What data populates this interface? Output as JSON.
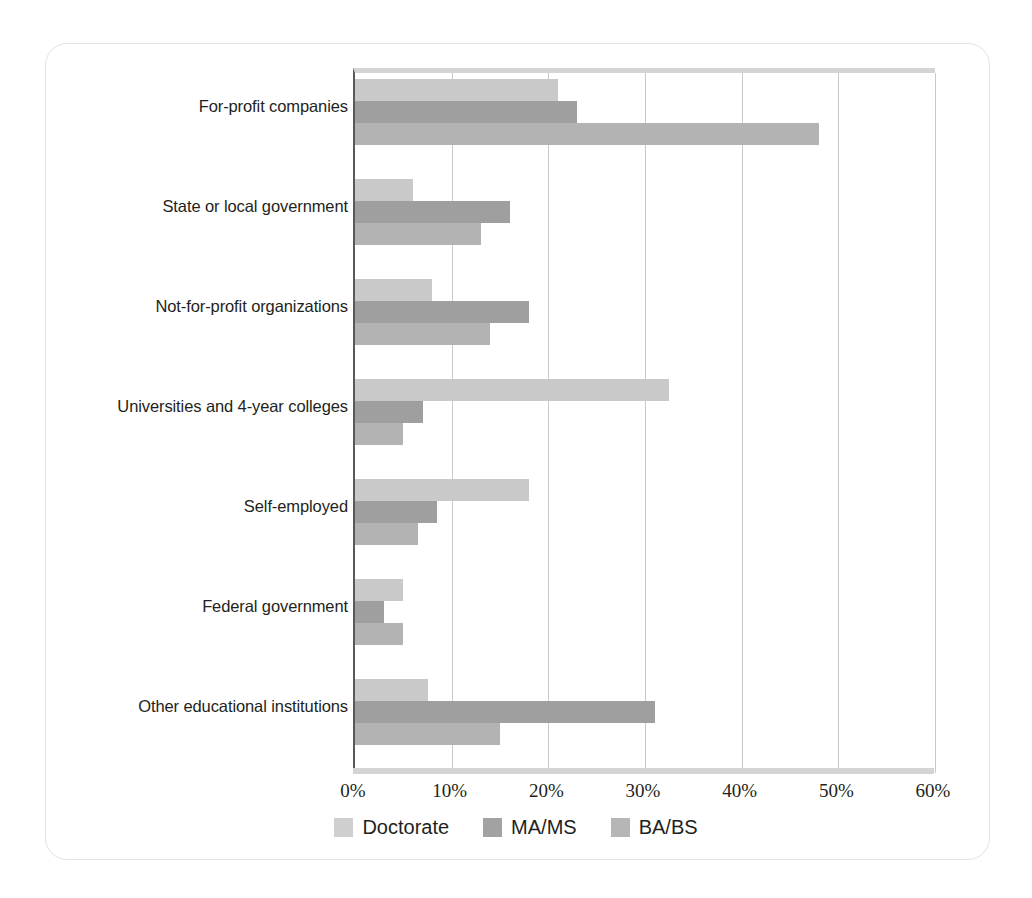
{
  "chart_data": {
    "type": "bar",
    "orientation": "horizontal",
    "title": "",
    "xlabel": "",
    "ylabel": "",
    "xlim": [
      0,
      60
    ],
    "xticks": [
      "0%",
      "10%",
      "20%",
      "30%",
      "40%",
      "50%",
      "60%"
    ],
    "xtick_values": [
      0,
      10,
      20,
      30,
      40,
      50,
      60
    ],
    "grid": true,
    "legend_position": "bottom",
    "categories": [
      "For-profit companies",
      "State or local government",
      "Not-for-profit organizations",
      "Universities and 4-year colleges",
      "Self-employed",
      "Federal government",
      "Other educational institutions"
    ],
    "series": [
      {
        "name": "Doctorate",
        "color": "#c9c9c9",
        "values": [
          21,
          6,
          8,
          32.5,
          18,
          5,
          7.5
        ]
      },
      {
        "name": "MA/MS",
        "color": "#9f9f9f",
        "values": [
          23,
          16,
          18,
          7,
          8.5,
          3,
          31
        ]
      },
      {
        "name": "BA/BS",
        "color": "#b3b3b3",
        "values": [
          48,
          13,
          14,
          5,
          6.5,
          5,
          15
        ]
      }
    ],
    "legend": [
      {
        "label": "Doctorate",
        "swatch": "doctorate"
      },
      {
        "label": "MA/MS",
        "swatch": "mams"
      },
      {
        "label": "BA/BS",
        "swatch": "babs"
      }
    ]
  },
  "colors": {
    "doctorate": "#c9c9c9",
    "mams": "#9f9f9f",
    "babs": "#b3b3b3",
    "gridline": "#c9c9c9",
    "axis": "#58595b",
    "card_border": "#e2e2e2",
    "text": "#231f20"
  }
}
